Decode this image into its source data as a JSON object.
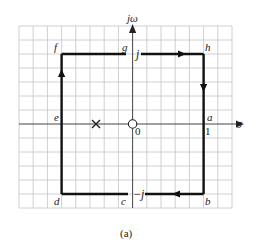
{
  "figure": {
    "caption": "(a)",
    "type": "s-plane contour diagram"
  },
  "axes": {
    "imag_label": "jω",
    "real_label": "σ",
    "origin_label": "0",
    "unit_label": "1",
    "j_label": "j",
    "neg_j_label": "−j"
  },
  "points": {
    "a": "a",
    "b": "b",
    "c": "c",
    "d": "d",
    "e": "e",
    "f": "f",
    "g": "g",
    "h": "h"
  },
  "markers": {
    "pole": "×",
    "zero": "○"
  },
  "colors": {
    "grid": "#bdbdbd",
    "axis": "#444444",
    "contour": "#111111",
    "background": "#ffffff"
  }
}
